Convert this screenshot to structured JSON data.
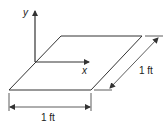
{
  "diagram": {
    "type": "dimensioned-square-plate",
    "axes": {
      "y_label": "y",
      "x_label": "x"
    },
    "dimensions": {
      "width_label": "1 ft",
      "depth_label": "1 ft"
    },
    "colors": {
      "line": "#333333",
      "text": "#222222",
      "background": "#ffffff"
    }
  }
}
